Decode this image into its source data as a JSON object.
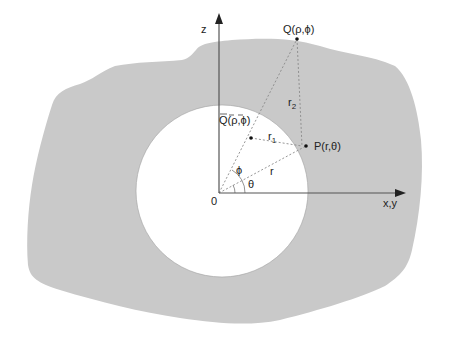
{
  "figure": {
    "region_fill": "#c9c9c9",
    "cavity_fill": "#ffffff",
    "axis_color": "#555555",
    "dash_color": "#888888"
  },
  "axes": {
    "vertical_label": "z",
    "horizontal_label": "x,y",
    "origin_label": "0"
  },
  "points": {
    "Q": {
      "label": "Q(ρ,ϕ)"
    },
    "P": {
      "label": "P(r,θ)"
    },
    "Qbar": {
      "label_letter": "Q",
      "label_rest": "(ρ,ϕ)"
    }
  },
  "distances": {
    "r": "r",
    "r1_base": "r",
    "r1_sub": "1",
    "r2_base": "r",
    "r2_sub": "2"
  },
  "angles": {
    "phi": "ϕ",
    "theta": "θ"
  }
}
